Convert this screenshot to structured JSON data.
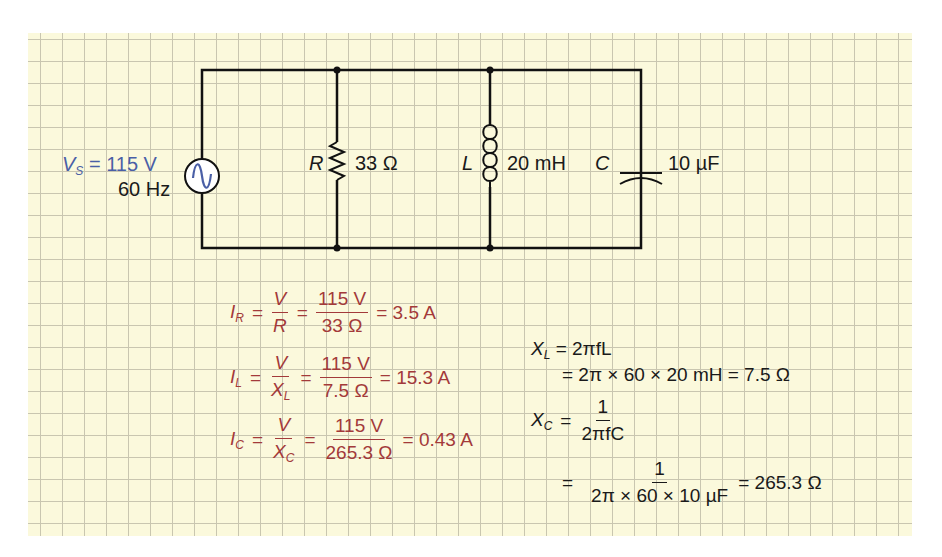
{
  "source": {
    "label": "V",
    "label_sub": "S",
    "voltage": "= 115 V",
    "frequency": "60 Hz",
    "color": "#4a5fa6"
  },
  "components": {
    "resistor": {
      "symbol": "R",
      "value": "33 Ω"
    },
    "inductor": {
      "symbol": "L",
      "value": "20 mH"
    },
    "capacitor": {
      "symbol": "C",
      "value": "10 µF"
    }
  },
  "currents": {
    "color": "#a33a3a",
    "ir": {
      "lhs": "I",
      "lhs_sub": "R",
      "f1_num": "V",
      "f1_den": "R",
      "f1_den_sub": "",
      "f2_num": "115 V",
      "f2_den": "33 Ω",
      "result": "= 3.5 A"
    },
    "il": {
      "lhs": "I",
      "lhs_sub": "L",
      "f1_num": "V",
      "f1_den": "X",
      "f1_den_sub": "L",
      "f2_num": "115 V",
      "f2_den": "7.5 Ω",
      "result": "= 15.3 A"
    },
    "ic": {
      "lhs": "I",
      "lhs_sub": "C",
      "f1_num": "V",
      "f1_den": "X",
      "f1_den_sub": "C",
      "f2_num": "115 V",
      "f2_den": "265.3 Ω",
      "result": "= 0.43 A"
    }
  },
  "reactances": {
    "xl": {
      "lhs": "X",
      "lhs_sub": "L",
      "line1": "= 2πfL",
      "line2": "= 2π × 60 × 20 mH = 7.5 Ω"
    },
    "xc": {
      "lhs": "X",
      "lhs_sub": "C",
      "f1_num": "1",
      "f1_den": "2πfC",
      "f2_num": "1",
      "f2_den": "2π × 60 × 10 µF",
      "result": "= 265.3 Ω"
    }
  },
  "equals": "="
}
